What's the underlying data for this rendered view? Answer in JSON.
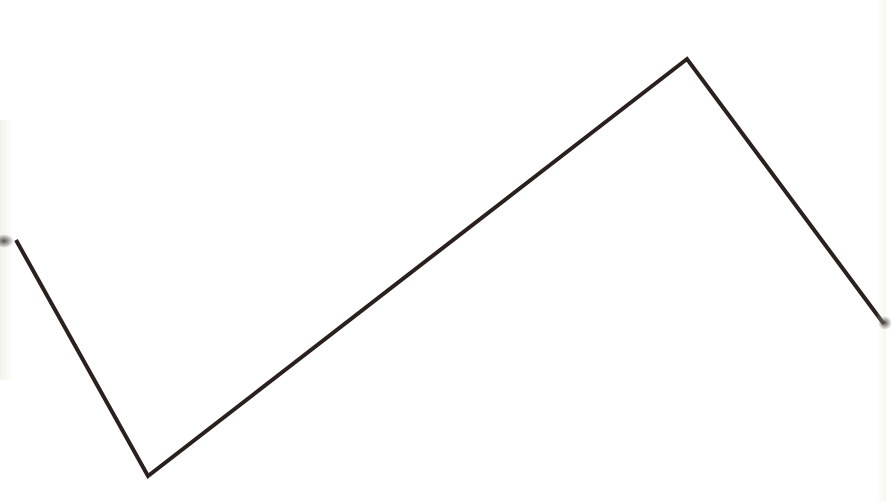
{
  "drawing": {
    "type": "polyline",
    "stroke_color": "#2a201d",
    "stroke_width": 4,
    "background": "#ffffff",
    "points": [
      [
        16,
        240
      ],
      [
        148,
        476
      ],
      [
        687,
        59
      ],
      [
        884,
        324
      ]
    ]
  }
}
